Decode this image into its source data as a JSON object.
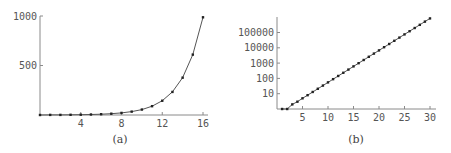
{
  "chart_data": [
    {
      "type": "line",
      "title": "",
      "caption": "(a)",
      "xlabel": "",
      "ylabel": "",
      "xlim": [
        0,
        16.6
      ],
      "ylim": [
        0,
        1000
      ],
      "grid": false,
      "legend": null,
      "markers": true,
      "x_ticks": [
        "4",
        "8",
        "12",
        "16"
      ],
      "y_ticks": [
        "500",
        "1000"
      ],
      "x": [
        0,
        1,
        2,
        3,
        4,
        5,
        6,
        7,
        8,
        9,
        10,
        11,
        12,
        13,
        14,
        15,
        16
      ],
      "values": [
        0,
        1,
        1,
        2,
        3,
        5,
        8,
        13,
        21,
        34,
        55,
        89,
        144,
        233,
        377,
        610,
        987
      ]
    },
    {
      "type": "line",
      "title": "",
      "caption": "(b)",
      "xlabel": "",
      "ylabel": "",
      "yscale": "log",
      "xlim": [
        0,
        30.5
      ],
      "ylim": [
        1,
        1000000
      ],
      "grid": false,
      "legend": null,
      "markers": true,
      "x_ticks": [
        "5",
        "10",
        "15",
        "20",
        "25",
        "30"
      ],
      "y_ticks": [
        "10",
        "100",
        "1000",
        "10000",
        "100000"
      ],
      "x": [
        1,
        2,
        3,
        4,
        5,
        6,
        7,
        8,
        9,
        10,
        11,
        12,
        13,
        14,
        15,
        16,
        17,
        18,
        19,
        20,
        21,
        22,
        23,
        24,
        25,
        26,
        27,
        28,
        29,
        30
      ],
      "values": [
        1,
        1,
        2,
        3,
        5,
        8,
        13,
        21,
        34,
        55,
        89,
        144,
        233,
        377,
        610,
        987,
        1597,
        2584,
        4181,
        6765,
        10946,
        17711,
        28657,
        46368,
        75025,
        121393,
        196418,
        317811,
        514229,
        832040
      ]
    }
  ]
}
